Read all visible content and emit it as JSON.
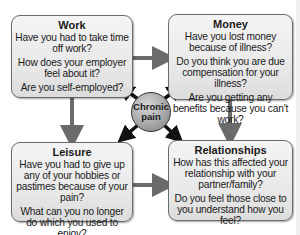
{
  "diagram": {
    "center": {
      "line1": "Chronic",
      "line2": "pain"
    },
    "boxes": {
      "work": {
        "title": "Work",
        "questions": [
          "Have you had to take time off work?",
          "How does your employer feel about it?",
          "Are you self-employed?"
        ]
      },
      "money": {
        "title": "Money",
        "questions": [
          "Have you lost money because of illness?",
          "Do you think you are due compensation for your illness?",
          "Are you getting any benefits because you can't work?"
        ]
      },
      "leisure": {
        "title": "Leisure",
        "questions": [
          "Have you had to give up any of your hobbies or pastimes because of your pain?",
          "What can you no longer do which you used to enjoy?"
        ]
      },
      "relationships": {
        "title": "Relationships",
        "questions": [
          "How has this affected your relationship with your partner/family?",
          "Do you feel those close to you understand how you feel?"
        ]
      }
    },
    "colors": {
      "box_fill": "#e9e9e9",
      "box_border": "#6a6a6a",
      "connector": "#6b6b6b",
      "hub_arrow": "#111111"
    }
  }
}
